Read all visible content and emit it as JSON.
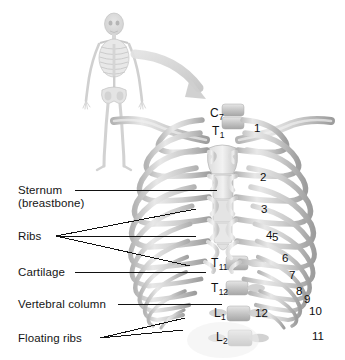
{
  "figure": {
    "background_color": "#ffffff",
    "bone_color": "#c9c9c9",
    "bone_light": "#efefef",
    "bone_shadow": "#9a9a9a",
    "arrow_color": "#cfcfcf",
    "leader_color": "#111111",
    "text_color": "#151515"
  },
  "inset": {
    "name": "whole-body-skeleton",
    "description": "small full skeleton, anterior view"
  },
  "arrow": {
    "name": "zoom-arrow",
    "description": "curved gray arrow from skeleton to rib cage"
  },
  "callouts": [
    {
      "id": "sternum",
      "line1": "Sternum",
      "line2": "(breastbone)",
      "x": 18,
      "y": 186,
      "leaders": 1
    },
    {
      "id": "ribs",
      "line1": "Ribs",
      "line2": "",
      "x": 18,
      "y": 231,
      "leaders": 3
    },
    {
      "id": "cartilage",
      "line1": "Cartilage",
      "line2": "",
      "x": 18,
      "y": 267,
      "leaders": 1
    },
    {
      "id": "vertebral-column",
      "line1": "Vertebral column",
      "line2": "",
      "x": 18,
      "y": 299,
      "leaders": 1
    },
    {
      "id": "floating-ribs",
      "line1": "Floating ribs",
      "line2": "",
      "x": 18,
      "y": 334,
      "leaders": 2
    }
  ],
  "vertebrae": [
    {
      "id": "c7",
      "letter": "C",
      "index": "7",
      "x": 210,
      "y": 112
    },
    {
      "id": "t1",
      "letter": "T",
      "index": "1",
      "x": 212,
      "y": 130
    },
    {
      "id": "t11",
      "letter": "T",
      "index": "11",
      "x": 211,
      "y": 262
    },
    {
      "id": "t12",
      "letter": "T",
      "index": "12",
      "x": 211,
      "y": 287
    },
    {
      "id": "l1",
      "letter": "L",
      "index": "1",
      "x": 214,
      "y": 312
    },
    {
      "id": "l2",
      "letter": "L",
      "index": "2",
      "x": 216,
      "y": 336
    }
  ],
  "rib_numbers": [
    {
      "label": "1",
      "x": 254,
      "y": 128
    },
    {
      "label": "2",
      "x": 260,
      "y": 177
    },
    {
      "label": "3",
      "x": 261,
      "y": 209
    },
    {
      "label": "4",
      "x": 266,
      "y": 235
    },
    {
      "label": "5",
      "x": 272,
      "y": 237
    },
    {
      "label": "6",
      "x": 282,
      "y": 258
    },
    {
      "label": "7",
      "x": 289,
      "y": 275
    },
    {
      "label": "8",
      "x": 296,
      "y": 291
    },
    {
      "label": "9",
      "x": 304,
      "y": 299
    },
    {
      "label": "10",
      "x": 309,
      "y": 311
    },
    {
      "label": "11",
      "x": 312,
      "y": 336
    },
    {
      "label": "12",
      "x": 255,
      "y": 313
    }
  ]
}
